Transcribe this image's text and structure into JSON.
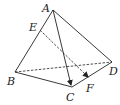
{
  "diagram": {
    "type": "tetrahedron",
    "stroke_color": "#222222",
    "background": "#ffffff",
    "points": {
      "A": {
        "label": "A",
        "x": 53,
        "y": 10,
        "lx": 42,
        "ly": 3
      },
      "B": {
        "label": "B",
        "x": 15,
        "y": 72,
        "lx": 7,
        "ly": 76
      },
      "C": {
        "label": "C",
        "x": 72,
        "y": 87,
        "lx": 66,
        "ly": 92
      },
      "D": {
        "label": "D",
        "x": 112,
        "y": 62,
        "lx": 109,
        "ly": 66
      },
      "E": {
        "label": "E",
        "x": 40,
        "y": 30,
        "lx": 29,
        "ly": 22
      },
      "F": {
        "label": "F",
        "x": 89,
        "y": 79,
        "lx": 86,
        "ly": 83
      }
    },
    "edges": [
      {
        "from": "A",
        "to": "B",
        "style": "solid"
      },
      {
        "from": "A",
        "to": "D",
        "style": "solid"
      },
      {
        "from": "B",
        "to": "C",
        "style": "solid"
      },
      {
        "from": "C",
        "to": "D",
        "style": "solid"
      },
      {
        "from": "B",
        "to": "D",
        "style": "dashed"
      }
    ],
    "vectors": [
      {
        "from": "A",
        "to": "C",
        "style": "solid",
        "arrow": true
      },
      {
        "from": "E",
        "to": "F",
        "style": "dashed",
        "arrow": true
      }
    ]
  }
}
